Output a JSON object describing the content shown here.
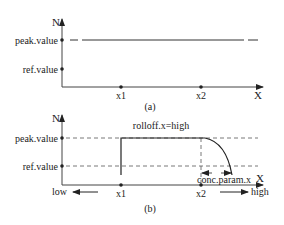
{
  "panel_a": {
    "caption": "(a)",
    "y_axis_label": "N",
    "x_axis_label": "X",
    "y_ticks": [
      "peak.value",
      "ref.value"
    ],
    "x_ticks": [
      "x1",
      "x2"
    ]
  },
  "panel_b": {
    "caption": "(b)",
    "y_axis_label": "N",
    "x_axis_label": "X",
    "y_ticks": [
      "peak.value",
      "ref.value"
    ],
    "x_ticks": [
      "x1",
      "x2"
    ],
    "curve_label": "rolloff.x=high",
    "interval_label": "conc.param.x",
    "direction_low": "low",
    "direction_high": "high"
  },
  "colors": {
    "ink": "#222222",
    "background": "#ffffff"
  }
}
